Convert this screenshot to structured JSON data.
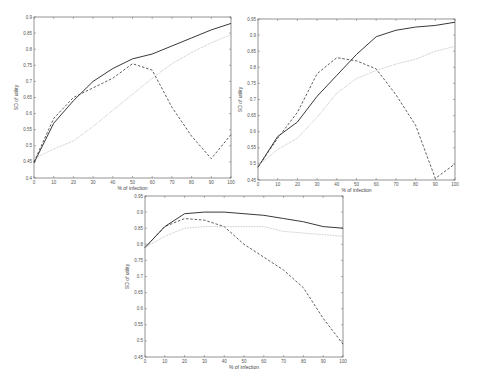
{
  "chart_data": [
    {
      "type": "line",
      "position": "top-left",
      "title": "",
      "xlabel": "% of infection",
      "ylabel": "SD of utility",
      "xlim": [
        0,
        100
      ],
      "ylim": [
        0.4,
        0.9
      ],
      "xticks": [
        0,
        10,
        20,
        30,
        40,
        50,
        60,
        70,
        80,
        90,
        100
      ],
      "yticks": [
        0.4,
        0.45,
        0.5,
        0.55,
        0.6,
        0.65,
        0.7,
        0.75,
        0.8,
        0.85,
        0.9
      ],
      "grid": false,
      "legend": null,
      "x": [
        0,
        10,
        20,
        30,
        40,
        50,
        60,
        70,
        80,
        90,
        100
      ],
      "series": [
        {
          "name": "solid",
          "style": "solid",
          "color": "#222222",
          "values": [
            0.447,
            0.57,
            0.64,
            0.7,
            0.74,
            0.77,
            0.785,
            0.81,
            0.835,
            0.86,
            0.88
          ]
        },
        {
          "name": "dashed",
          "style": "dashed",
          "color": "#333333",
          "values": [
            0.45,
            0.585,
            0.65,
            0.68,
            0.71,
            0.755,
            0.735,
            0.62,
            0.53,
            0.46,
            0.535
          ]
        },
        {
          "name": "dotted",
          "style": "dotted",
          "color": "#bbbbbb",
          "values": [
            0.46,
            0.49,
            0.515,
            0.56,
            0.61,
            0.66,
            0.71,
            0.755,
            0.79,
            0.82,
            0.845
          ]
        }
      ]
    },
    {
      "type": "line",
      "position": "top-right",
      "title": "",
      "xlabel": "% of infection",
      "ylabel": "SD of utility",
      "xlim": [
        0,
        100
      ],
      "ylim": [
        0.45,
        0.95
      ],
      "xticks": [
        0,
        10,
        20,
        30,
        40,
        50,
        60,
        70,
        80,
        90,
        100
      ],
      "yticks": [
        0.45,
        0.5,
        0.55,
        0.6,
        0.65,
        0.7,
        0.75,
        0.8,
        0.85,
        0.9,
        0.95
      ],
      "grid": false,
      "legend": null,
      "x": [
        0,
        10,
        20,
        30,
        40,
        50,
        60,
        70,
        80,
        90,
        100
      ],
      "series": [
        {
          "name": "solid",
          "style": "solid",
          "color": "#222222",
          "values": [
            0.49,
            0.585,
            0.63,
            0.71,
            0.775,
            0.84,
            0.895,
            0.915,
            0.925,
            0.93,
            0.94
          ]
        },
        {
          "name": "dashed",
          "style": "dashed",
          "color": "#333333",
          "values": [
            0.49,
            0.58,
            0.66,
            0.78,
            0.83,
            0.82,
            0.795,
            0.715,
            0.62,
            0.455,
            0.5
          ]
        },
        {
          "name": "dotted",
          "style": "dotted",
          "color": "#bbbbbb",
          "values": [
            0.495,
            0.545,
            0.58,
            0.645,
            0.72,
            0.765,
            0.79,
            0.81,
            0.825,
            0.85,
            0.865
          ]
        }
      ]
    },
    {
      "type": "line",
      "position": "bottom-center",
      "title": "",
      "xlabel": "% of infection",
      "ylabel": "SD of utility",
      "xlim": [
        0,
        100
      ],
      "ylim": [
        0.45,
        0.95
      ],
      "xticks": [
        0,
        10,
        20,
        30,
        40,
        50,
        60,
        70,
        80,
        90,
        100
      ],
      "yticks": [
        0.45,
        0.5,
        0.55,
        0.6,
        0.65,
        0.7,
        0.75,
        0.8,
        0.85,
        0.9,
        0.95
      ],
      "grid": false,
      "legend": null,
      "x": [
        0,
        10,
        20,
        30,
        40,
        50,
        60,
        70,
        80,
        90,
        100
      ],
      "series": [
        {
          "name": "solid",
          "style": "solid",
          "color": "#222222",
          "values": [
            0.79,
            0.855,
            0.895,
            0.9,
            0.9,
            0.895,
            0.89,
            0.88,
            0.87,
            0.855,
            0.85
          ]
        },
        {
          "name": "dashed",
          "style": "dashed",
          "color": "#333333",
          "values": [
            0.79,
            0.855,
            0.88,
            0.875,
            0.855,
            0.8,
            0.76,
            0.72,
            0.665,
            0.57,
            0.49
          ]
        },
        {
          "name": "dotted",
          "style": "dotted",
          "color": "#bbbbbb",
          "values": [
            0.79,
            0.825,
            0.85,
            0.855,
            0.855,
            0.855,
            0.855,
            0.84,
            0.835,
            0.83,
            0.825
          ]
        }
      ]
    }
  ],
  "layout": {
    "frames": [
      {
        "left": 34,
        "top": 17,
        "right": 231,
        "bottom": 178
      },
      {
        "left": 258,
        "top": 19,
        "right": 455,
        "bottom": 180
      },
      {
        "left": 145,
        "top": 196,
        "right": 343,
        "bottom": 357
      }
    ]
  }
}
